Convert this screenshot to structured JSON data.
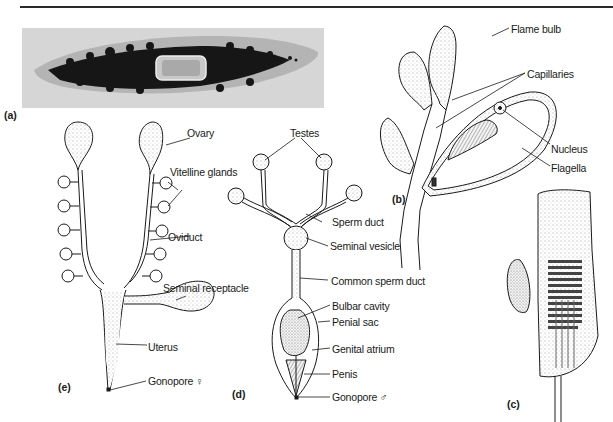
{
  "figure": {
    "panels": {
      "a": "(a)",
      "b": "(b)",
      "c": "(c)",
      "d": "(d)",
      "e": "(e)"
    },
    "labels_b": {
      "flame_bulb": "Flame bulb",
      "capillaries": "Capillaries",
      "nucleus": "Nucleus",
      "flagella": "Flagella"
    },
    "labels_e": {
      "ovary": "Ovary",
      "vitelline_glands": "Vitelline glands",
      "oviduct": "Oviduct",
      "seminal_receptacle": "Seminal receptacle",
      "uterus": "Uterus",
      "gonopore": "Gonopore ♀"
    },
    "labels_d": {
      "testes": "Testes",
      "sperm_duct": "Sperm duct",
      "seminal_vesicle": "Seminal vesicle",
      "common_sperm_duct": "Common sperm duct",
      "bulbar_cavity": "Bulbar cavity",
      "penial_sac": "Penial sac",
      "genital_atrium": "Genital atrium",
      "penis": "Penis",
      "gonopore": "Gonopore ♂"
    },
    "colors": {
      "ink": "#1a1a1a",
      "stipple": "#9a9a9a",
      "photo_bg": "#d6d6d6",
      "photo_body": "#b8b8b8",
      "photo_dark": "#151515"
    }
  }
}
